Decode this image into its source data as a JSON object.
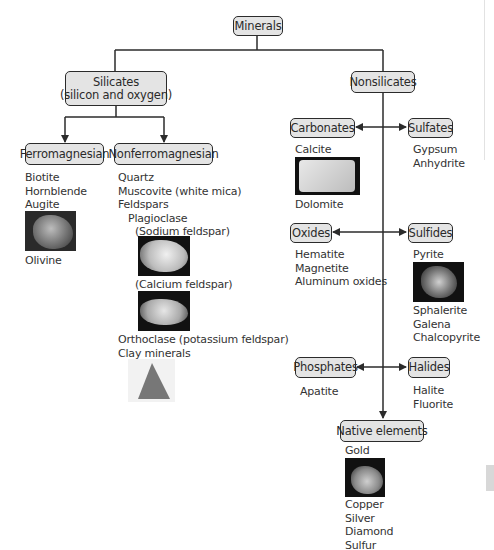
{
  "diagram": {
    "root": {
      "label": "Minerals"
    },
    "silicates": {
      "label_line1": "Silicates",
      "label_line2": "(silicon and oxygen)",
      "ferromagnesian": {
        "label": "Ferromagnesian",
        "items": [
          "Biotite",
          "Hornblende",
          "Augite"
        ],
        "photo": "olivine-photo",
        "after_photo": [
          "Olivine"
        ]
      },
      "nonferromagnesian": {
        "label": "Nonferromagnesian",
        "items": [
          "Quartz",
          "Muscovite (white mica)",
          "Feldspars"
        ],
        "plagioclase": "Plagioclase",
        "sodium": "(Sodium feldspar)",
        "calcium": "(Calcium feldspar)",
        "orthoclase": "Orthoclase (potassium feldspar)",
        "clay": "Clay minerals"
      }
    },
    "nonsilicates": {
      "label": "Nonsilicates",
      "carbonates": {
        "label": "Carbonates",
        "before_photo": [
          "Calcite"
        ],
        "after_photo": [
          "Dolomite"
        ]
      },
      "sulfates": {
        "label": "Sulfates",
        "items": [
          "Gypsum",
          "Anhydrite"
        ]
      },
      "oxides": {
        "label": "Oxides",
        "items": [
          "Hematite",
          "Magnetite",
          "Aluminum oxides"
        ]
      },
      "sulfides": {
        "label": "Sulfides",
        "before_photo": [
          "Pyrite"
        ],
        "after_photo": [
          "Sphalerite",
          "Galena",
          "Chalcopyrite"
        ]
      },
      "phosphates": {
        "label": "Phosphates",
        "items": [
          "Apatite"
        ]
      },
      "halides": {
        "label": "Halides",
        "items": [
          "Halite",
          "Fluorite"
        ]
      },
      "native": {
        "label": "Native elements",
        "before_photo": [
          "Gold"
        ],
        "after_photo": [
          "Copper",
          "Silver",
          "Diamond",
          "Sulfur"
        ]
      }
    }
  },
  "colors": {
    "box_fill": "#e4e4e4",
    "line": "#2b2b2b",
    "text": "#333333"
  }
}
